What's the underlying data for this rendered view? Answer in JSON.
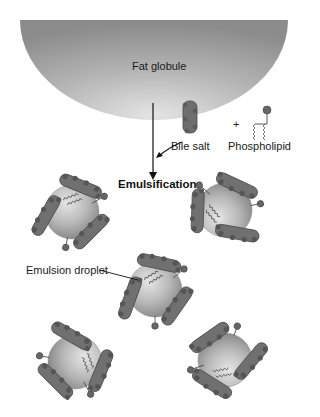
{
  "diagram": {
    "labels": {
      "fat_globule": "Fat globule",
      "bile_salt": "Bile salt",
      "plus": "+",
      "phospholipid": "Phospholipid",
      "process": "Emulsification",
      "emulsion_droplet": "Emulsion droplet"
    },
    "colors": {
      "globule": "#a8a8a8",
      "droplet": "#b8b8b8",
      "bile_salt": "#6e6e6e",
      "bead": "#5a5a5a",
      "line": "#111111"
    },
    "droplets": [
      {
        "id": 1,
        "cx": 72,
        "cy": 212
      },
      {
        "id": 2,
        "cx": 225,
        "cy": 210
      },
      {
        "id": 3,
        "cx": 155,
        "cy": 290
      },
      {
        "id": 4,
        "cx": 75,
        "cy": 362
      },
      {
        "id": 5,
        "cx": 225,
        "cy": 360
      }
    ]
  }
}
